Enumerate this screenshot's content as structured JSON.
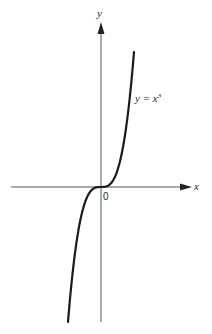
{
  "chart_data": {
    "type": "line",
    "title": "",
    "xlabel": "x",
    "ylabel": "y",
    "origin_label": "0",
    "series": [
      {
        "name": "y = x^3",
        "label_text": "y = x",
        "label_exponent": "3",
        "function": "x^3",
        "x": [
          -1.5,
          -1.25,
          -1.0,
          -0.75,
          -0.5,
          -0.25,
          0,
          0.25,
          0.5,
          0.75,
          1.0,
          1.25,
          1.5
        ],
        "values": [
          -3.375,
          -1.953,
          -1.0,
          -0.422,
          -0.125,
          -0.016,
          0,
          0.016,
          0.125,
          0.422,
          1.0,
          1.953,
          3.375
        ]
      }
    ],
    "grid": false,
    "ticks": false,
    "legend": "inline label near upper branch of curve",
    "colors": {
      "curve": "#1a1a1a",
      "axes": "#555555",
      "background": "#ffffff"
    }
  }
}
